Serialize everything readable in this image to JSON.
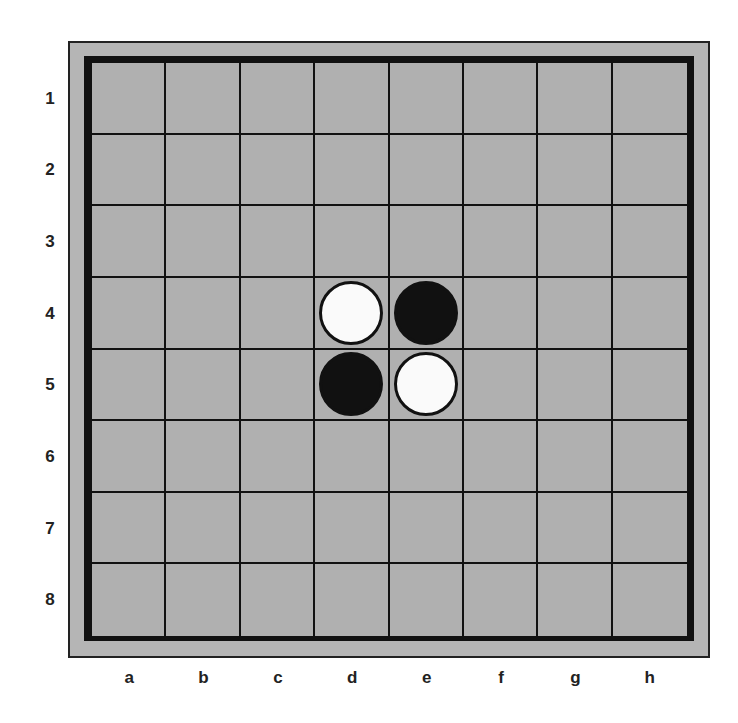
{
  "board": {
    "size": 8,
    "columns": [
      "a",
      "b",
      "c",
      "d",
      "e",
      "f",
      "g",
      "h"
    ],
    "rows": [
      "1",
      "2",
      "3",
      "4",
      "5",
      "6",
      "7",
      "8"
    ],
    "colors": {
      "frame": "#b5b5b5",
      "cell": "#b0b0b0",
      "lines": "#111111",
      "white_disc": "#fafafa",
      "black_disc": "#111111"
    },
    "pieces": [
      {
        "square": "d4",
        "color": "white"
      },
      {
        "square": "e4",
        "color": "black"
      },
      {
        "square": "d5",
        "color": "black"
      },
      {
        "square": "e5",
        "color": "white"
      }
    ]
  }
}
